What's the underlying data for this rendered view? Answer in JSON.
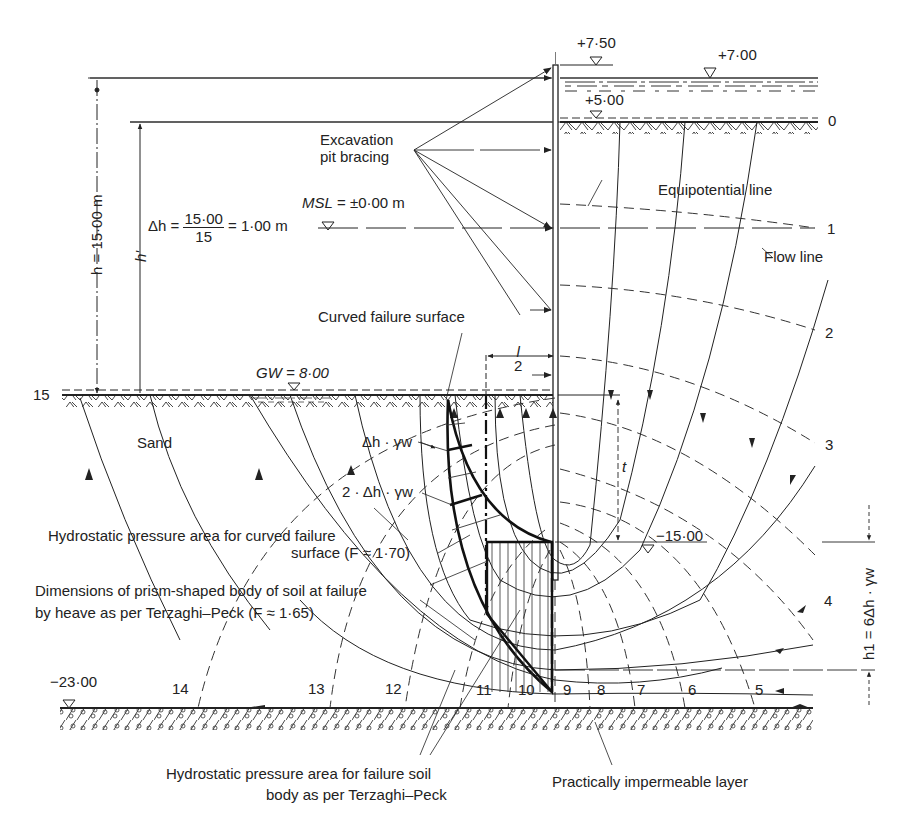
{
  "diagram": {
    "elevations": {
      "wall_top": "+7·50",
      "water_level_outside": "+7·00",
      "ground_outside": "+5·00",
      "wall_toe": "−15·00",
      "impermeable_top": "−23·00"
    },
    "labels": {
      "excavation_bracing_line1": "Excavation",
      "excavation_bracing_line2": "pit bracing",
      "msl": "MSL = ±0·00 m",
      "msl_italic": "MSL",
      "msl_rest": " = ±0·00 m",
      "delta_h_lhs": "Δh =",
      "delta_h_num": "15·00",
      "delta_h_den": "15",
      "delta_h_rhs": "= 1·00 m",
      "h_total": "h = 15·00 m",
      "h_prime": "h'",
      "equipotential_line": "Equipotential line",
      "flow_line": "Flow line",
      "curved_failure_surface": "Curved failure surface",
      "l_over_2_num": "l",
      "l_over_2_den": "2",
      "gw": "GW = 8·00",
      "sand": "Sand",
      "dh_gw": "Δh · γw",
      "two_dh_gw": "2 · Δh · γw",
      "t": "t",
      "hydro_curved_line1": "Hydrostatic pressure area for curved failure",
      "hydro_curved_line2": "surface (F ≈ 1·70)",
      "prism_line1": "Dimensions of prism-shaped body of soil at failure",
      "prism_line2": "by heave as per Terzaghi–Peck (F ≈ 1·65)",
      "hydro_tp_line1": "Hydrostatic pressure area for failure soil",
      "hydro_tp_line2": "body as per Terzaghi–Peck",
      "impermeable": "Practically impermeable layer",
      "h1": "h1 = 6Δh · γw"
    },
    "equipotential_numbers": {
      "right": [
        "0",
        "1",
        "2",
        "3",
        "4"
      ],
      "bottom": [
        "5",
        "6",
        "7",
        "8",
        "9",
        "10",
        "11",
        "12",
        "13",
        "14"
      ],
      "left": "15"
    },
    "colors": {
      "ink": "#222222",
      "background": "#ffffff"
    }
  }
}
